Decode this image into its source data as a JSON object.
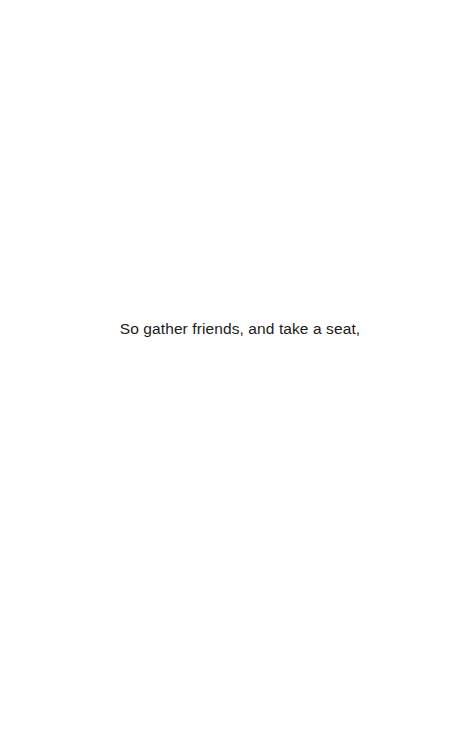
{
  "page": {
    "background": "#ffffff",
    "text_color": "#1a1a1a",
    "lines": [
      "So gather friends, and take a seat,"
    ]
  }
}
